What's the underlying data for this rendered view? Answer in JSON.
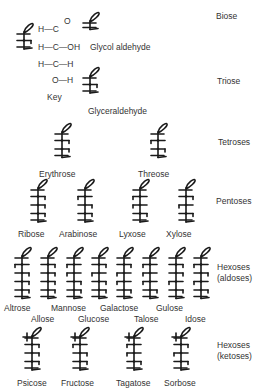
{
  "key": {
    "label": "Key",
    "rows": [
      "H—C=O",
      "H—C—OH",
      "H—C—H",
      "O—H"
    ],
    "row_texts": {
      "r1a": "H—C",
      "r1b": "O",
      "r2": "H—C—OH",
      "r3": "H—C—H",
      "r4": "O—H"
    }
  },
  "categories": [
    {
      "id": "biose",
      "label": "Biose"
    },
    {
      "id": "triose",
      "label": "Triose"
    },
    {
      "id": "tetroses",
      "label": "Tetroses"
    },
    {
      "id": "pentoses",
      "label": "Pentoses"
    },
    {
      "id": "hexoses_aldoses",
      "label": "Hexoses\n(aldoses)",
      "line1": "Hexoses",
      "line2": "(aldoses)"
    },
    {
      "id": "hexoses_ketoses",
      "label": "Hexoses\n(ketoses)",
      "line1": "Hexoses",
      "line2": "(ketoses)"
    }
  ],
  "molecules": [
    {
      "name": "Glycol aldehyde",
      "type": "aldose",
      "rows": [],
      "x": 80,
      "y": 13,
      "lx": 90,
      "ly": 42
    },
    {
      "name": "Glyceraldehyde",
      "type": "aldose",
      "rows": [
        "r"
      ],
      "x": 80,
      "y": 68,
      "lx": 88,
      "ly": 106
    },
    {
      "name": "Erythrose",
      "type": "aldose",
      "rows": [
        "r",
        "r"
      ],
      "x": 52,
      "y": 124,
      "lx": 39,
      "ly": 169
    },
    {
      "name": "Threose",
      "type": "aldose",
      "rows": [
        "l",
        "r"
      ],
      "x": 148,
      "y": 124,
      "lx": 138,
      "ly": 169
    },
    {
      "name": "Ribose",
      "type": "aldose",
      "rows": [
        "r",
        "r",
        "r"
      ],
      "x": 28,
      "y": 180,
      "lx": 18,
      "ly": 229
    },
    {
      "name": "Arabinose",
      "type": "aldose",
      "rows": [
        "l",
        "r",
        "r"
      ],
      "x": 75,
      "y": 180,
      "lx": 59,
      "ly": 229
    },
    {
      "name": "Lyxose",
      "type": "aldose",
      "rows": [
        "l",
        "l",
        "r"
      ],
      "x": 130,
      "y": 180,
      "lx": 119,
      "ly": 229
    },
    {
      "name": "Xylose",
      "type": "aldose",
      "rows": [
        "r",
        "l",
        "r"
      ],
      "x": 176,
      "y": 180,
      "lx": 166,
      "ly": 229
    },
    {
      "name": "Altrose",
      "type": "aldose",
      "rows": [
        "l",
        "r",
        "r",
        "r"
      ],
      "x": 12,
      "y": 248,
      "lx": 4,
      "ly": 303
    },
    {
      "name": "Allose",
      "type": "aldose",
      "rows": [
        "r",
        "r",
        "r",
        "r"
      ],
      "x": 38,
      "y": 248,
      "lx": 31,
      "ly": 314
    },
    {
      "name": "Mannose",
      "type": "aldose",
      "rows": [
        "l",
        "l",
        "r",
        "r"
      ],
      "x": 64,
      "y": 248,
      "lx": 51,
      "ly": 303
    },
    {
      "name": "Glucose",
      "type": "aldose",
      "rows": [
        "r",
        "l",
        "r",
        "r"
      ],
      "x": 89,
      "y": 248,
      "lx": 78,
      "ly": 314
    },
    {
      "name": "Galactose",
      "type": "aldose",
      "rows": [
        "r",
        "l",
        "l",
        "r"
      ],
      "x": 114,
      "y": 248,
      "lx": 100,
      "ly": 303
    },
    {
      "name": "Talose",
      "type": "aldose",
      "rows": [
        "l",
        "l",
        "l",
        "r"
      ],
      "x": 140,
      "y": 248,
      "lx": 134,
      "ly": 314
    },
    {
      "name": "Gulose",
      "type": "aldose",
      "rows": [
        "r",
        "r",
        "l",
        "r"
      ],
      "x": 166,
      "y": 248,
      "lx": 156,
      "ly": 303
    },
    {
      "name": "Idose",
      "type": "aldose",
      "rows": [
        "l",
        "r",
        "l",
        "r"
      ],
      "x": 191,
      "y": 248,
      "lx": 185,
      "ly": 314
    },
    {
      "name": "Psicose",
      "type": "ketose",
      "rows": [
        "r",
        "r",
        "r"
      ],
      "x": 22,
      "y": 328,
      "lx": 17,
      "ly": 378
    },
    {
      "name": "Fructose",
      "type": "ketose",
      "rows": [
        "l",
        "r",
        "r"
      ],
      "x": 70,
      "y": 328,
      "lx": 61,
      "ly": 378
    },
    {
      "name": "Tagatose",
      "type": "ketose",
      "rows": [
        "l",
        "l",
        "r"
      ],
      "x": 124,
      "y": 328,
      "lx": 116,
      "ly": 378
    },
    {
      "name": "Sorbose",
      "type": "ketose",
      "rows": [
        "r",
        "l",
        "r"
      ],
      "x": 171,
      "y": 328,
      "lx": 164,
      "ly": 378
    }
  ],
  "colors": {
    "ink": "#1a1a1a",
    "text": "#333333",
    "background": "#ffffff"
  }
}
